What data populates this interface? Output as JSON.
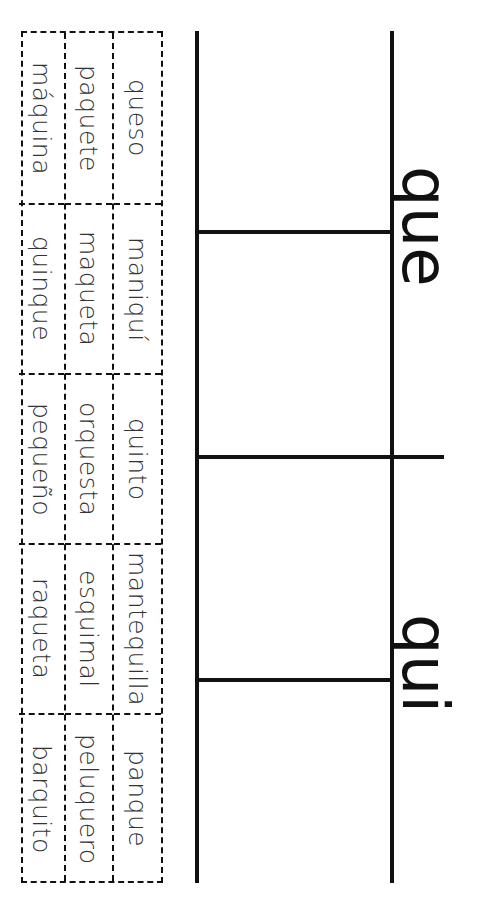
{
  "worksheet": {
    "orientation": "rotated-90-clockwise",
    "headings": [
      {
        "label": "que"
      },
      {
        "label": "qui"
      }
    ],
    "cards": {
      "columns": [
        [
          "queso",
          "maniquí",
          "quinto",
          "mantequilla",
          "panque"
        ],
        [
          "paquete",
          "maqueta",
          "orquesta",
          "esquimal",
          "peluquero"
        ],
        [
          "máquina",
          "quinque",
          "pequeño",
          "raqueta",
          "barquito"
        ]
      ]
    },
    "colors": {
      "ink": "#111111",
      "card_text": "#333333",
      "background": "#ffffff"
    }
  }
}
